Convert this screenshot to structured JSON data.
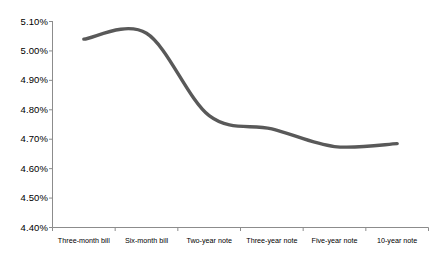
{
  "chart_data": {
    "type": "line",
    "title": "",
    "subtitle": "",
    "xlabel": "",
    "ylabel": "",
    "categories": [
      "Three-month bill",
      "Six-month bill",
      "Two-year note",
      "Three-year note",
      "Five-year note",
      "10-year note"
    ],
    "values": [
      5.04,
      5.06,
      4.78,
      4.735,
      4.675,
      4.685
    ],
    "value_labels": [
      "5.04%",
      "5.06%",
      "4.78%",
      "4.74%",
      "4.68%",
      "4.69%"
    ],
    "series": [
      {
        "name": "Treasury yield",
        "values": [
          5.04,
          5.06,
          4.78,
          4.735,
          4.675,
          4.685
        ],
        "color": "#595959"
      }
    ],
    "ylim": [
      4.4,
      5.1
    ],
    "ytick_values": [
      5.1,
      5.0,
      4.9,
      4.8,
      4.7,
      4.6,
      4.5,
      4.4
    ],
    "ytick_labels": [
      "5.10%",
      "5.00%",
      "4.90%",
      "4.80%",
      "4.70%",
      "4.60%",
      "4.50%",
      "4.40%"
    ],
    "xtick_labels": [
      "Three-month bill",
      "Six-month bill",
      "Two-year note",
      "Three-year note",
      "Five-year note",
      "10-year note"
    ],
    "grid": false,
    "legend": false,
    "legend_position": "none",
    "smoothing": "spline",
    "markers": false,
    "line_width_px": 3.4,
    "annotations": []
  },
  "style": {
    "background_color": "#ffffff",
    "axis_color": "#8c8c8c",
    "line_color": "#595959",
    "text_color": "#000000"
  }
}
